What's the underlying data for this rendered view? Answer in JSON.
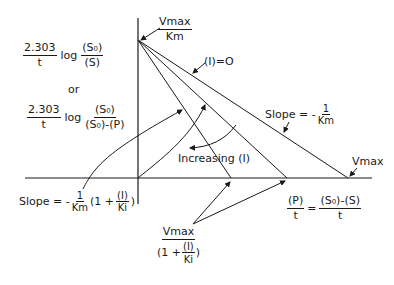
{
  "diagram": {
    "type": "enzyme-kinetics-integrated-rate-plot",
    "y_axis_label": {
      "expr1": {
        "coef_num": "2.303",
        "coef_den": "t",
        "log": "log",
        "num": "(S₀)",
        "den": "(S)"
      },
      "or": "or",
      "expr2": {
        "coef_num": "2.303",
        "coef_den": "t",
        "log": "log",
        "num": "(S₀)",
        "den": "(S₀)-(P)"
      }
    },
    "y_intercept_label": {
      "num": "Vmax",
      "den": "Km"
    },
    "line_label_zero": "(I)=O",
    "slope_label_right": {
      "prefix": "Slope = -",
      "num": "1",
      "den": "Km"
    },
    "increasing_label": "Increasing (I)",
    "x_intercept_vmax": "Vmax",
    "x_axis_label": {
      "lhs_num": "(P)",
      "lhs_den": "t",
      "eq": "=",
      "rhs_num": "(S₀)-(S)",
      "rhs_den": "t"
    },
    "slope_label_left": {
      "prefix": "Slope = -",
      "num": "1",
      "den": "Km",
      "paren_open": "(1 +",
      "inner_num": "(I)",
      "inner_den": "Ki",
      "paren_close": ")"
    },
    "x_intercept_inhibited": {
      "num": "Vmax",
      "den_prefix": "(1 +",
      "inner_num": "(I)",
      "inner_den": "Ki",
      "den_suffix": ")"
    },
    "colors": {
      "ink": "#1a1a1a",
      "background": "#ffffff"
    },
    "geometry": {
      "origin": [
        138,
        178
      ],
      "y_intercept": [
        138,
        40
      ],
      "x_intercepts": [
        231,
        287,
        348
      ]
    }
  }
}
